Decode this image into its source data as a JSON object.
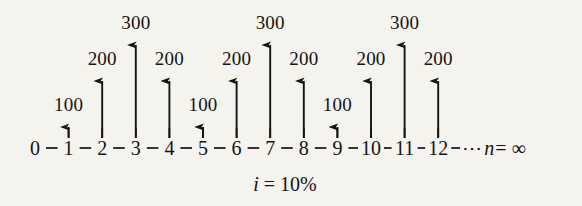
{
  "diagram": {
    "interest_rate_label": "i = 10%",
    "interest_rate_symbol": "i",
    "interest_rate_value": "= 10%",
    "timeline_tail_ellipsis": "⋯",
    "timeline_tail_n": "n",
    "timeline_tail_value": "= ∞",
    "colors": {
      "background": "#f5f3ee",
      "ink": "#141414"
    }
  },
  "chart_data": {
    "type": "bar",
    "xlabel": "",
    "ylabel": "",
    "grid": false,
    "legend": null,
    "interest_rate": "10%",
    "horizon": "n = ∞",
    "categories": [
      "0",
      "1",
      "2",
      "3",
      "4",
      "5",
      "6",
      "7",
      "8",
      "9",
      "10",
      "11",
      "12"
    ],
    "values": [
      0,
      100,
      200,
      300,
      200,
      100,
      200,
      300,
      200,
      100,
      200,
      300,
      200
    ],
    "ylim": [
      0,
      300
    ],
    "annotations": [
      "i = 10%",
      "n = ∞"
    ],
    "pattern_note": "Repeating 5-period cycle: 100, 200, 300, 200, 100"
  },
  "periods": [
    {
      "label": "0",
      "value": null,
      "value_label": ""
    },
    {
      "label": "1",
      "value": 100,
      "value_label": "100"
    },
    {
      "label": "2",
      "value": 200,
      "value_label": "200"
    },
    {
      "label": "3",
      "value": 300,
      "value_label": "300"
    },
    {
      "label": "4",
      "value": 200,
      "value_label": "200"
    },
    {
      "label": "5",
      "value": 100,
      "value_label": "100"
    },
    {
      "label": "6",
      "value": 200,
      "value_label": "200"
    },
    {
      "label": "7",
      "value": 300,
      "value_label": "300"
    },
    {
      "label": "8",
      "value": 200,
      "value_label": "200"
    },
    {
      "label": "9",
      "value": 100,
      "value_label": "100"
    },
    {
      "label": "10",
      "value": 200,
      "value_label": "200"
    },
    {
      "label": "11",
      "value": 300,
      "value_label": "300"
    },
    {
      "label": "12",
      "value": 200,
      "value_label": "200"
    }
  ]
}
